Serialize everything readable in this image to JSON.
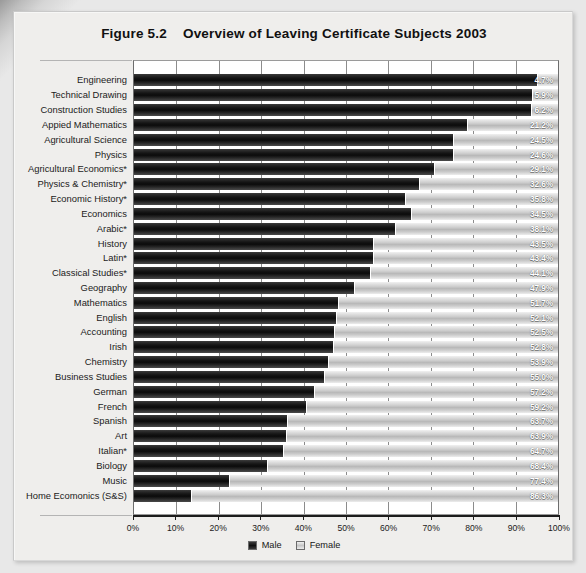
{
  "title": {
    "number": "Figure 5.2",
    "text": "Overview of Leaving Certificate Subjects 2003"
  },
  "legend": {
    "male_label": "Male",
    "female_label": "Female"
  },
  "axis": {
    "ticks": [
      "0%",
      "10%",
      "20%",
      "30%",
      "40%",
      "50%",
      "60%",
      "70%",
      "80%",
      "90%",
      "100%"
    ]
  },
  "chart_data": {
    "type": "bar",
    "orientation": "horizontal",
    "stacked": true,
    "stack_mode": "percent",
    "xlabel": "",
    "ylabel": "",
    "xlim": [
      0,
      100
    ],
    "grid": true,
    "legend_position": "bottom-center",
    "tick_labels": [
      "0%",
      "10%",
      "20%",
      "30%",
      "40%",
      "50%",
      "60%",
      "70%",
      "80%",
      "90%",
      "100%"
    ],
    "categories": [
      "Engineering",
      "Technical Drawing",
      "Construction Studies",
      "Appied Mathematics",
      "Agricultural Science",
      "Physics",
      "Agricultural Economics*",
      "Physics & Chemistry*",
      "Economic History*",
      "Economics",
      "Arabic*",
      "History",
      "Latin*",
      "Classical Studies*",
      "Geography",
      "Mathematics",
      "English",
      "Accounting",
      "Irish",
      "Chemistry",
      "Business Studies",
      "German",
      "French",
      "Spanish",
      "Art",
      "Italian*",
      "Biology",
      "Music",
      "Home Ecomonics (S&S)"
    ],
    "series": [
      {
        "name": "Male",
        "values": [
          95.3,
          94.1,
          93.8,
          78.8,
          75.5,
          75.4,
          70.9,
          67.4,
          64.2,
          65.5,
          61.9,
          56.5,
          56.6,
          55.9,
          52.1,
          48.3,
          47.9,
          47.5,
          47.2,
          46.1,
          45.0,
          42.8,
          40.8,
          36.3,
          36.1,
          35.3,
          31.6,
          22.6,
          13.7
        ]
      },
      {
        "name": "Female",
        "values": [
          4.7,
          5.9,
          6.2,
          21.2,
          24.5,
          24.6,
          29.1,
          32.6,
          35.8,
          34.5,
          38.1,
          43.5,
          43.4,
          44.1,
          47.9,
          51.7,
          52.1,
          52.5,
          52.8,
          53.9,
          55.0,
          57.2,
          59.2,
          63.7,
          63.9,
          64.7,
          68.4,
          77.4,
          86.3
        ]
      }
    ],
    "data_labels": [
      "4.7%",
      "5.9%",
      "6.2%",
      "21.2%",
      "24.5%",
      "24.6%",
      "29.1%",
      "32.6%",
      "35.8%",
      "34.5%",
      "38.1%",
      "43.5%",
      "43.4%",
      "44.1%",
      "47.9%",
      "51.7%",
      "52.1%",
      "52.5%",
      "52.8%",
      "53.9%",
      "55.0%",
      "57.2%",
      "59.2%",
      "63.7%",
      "63.9%",
      "64.7%",
      "68.4%",
      "77.4%",
      "86.3%"
    ],
    "data_label_series": "Female",
    "colors": {
      "male": "#141414",
      "female": "#c8c8c8",
      "plot_background": "#ffffff",
      "page_background": "#efeeec",
      "text": "#1b1b1b",
      "data_label_text": "#ffffff"
    }
  }
}
